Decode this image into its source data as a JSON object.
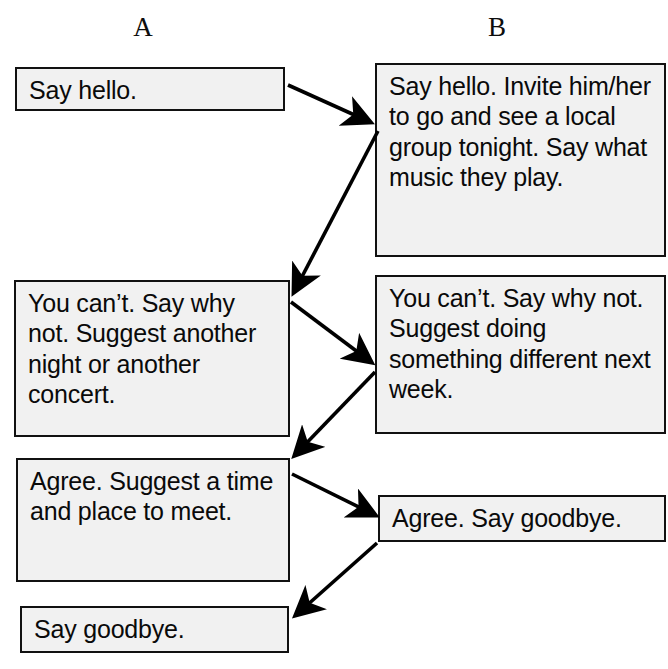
{
  "diagram": {
    "title_absent": "",
    "columns": [
      {
        "key": "A",
        "label": "A"
      },
      {
        "key": "B",
        "label": "B"
      }
    ],
    "colors": {
      "box_fill": "#f1f1f1",
      "box_border": "#111111",
      "text": "#0a0a0a",
      "arrow": "#000000",
      "background": "#ffffff"
    },
    "boxes": {
      "a1": {
        "column": "A",
        "order": 1,
        "text": "Say hello."
      },
      "a2": {
        "column": "A",
        "order": 2,
        "text": "You can’t. Say why not. Suggest another night or another concert."
      },
      "a3": {
        "column": "A",
        "order": 3,
        "text": "Agree. Suggest a time and place to meet."
      },
      "a4": {
        "column": "A",
        "order": 4,
        "text": "Say goodbye."
      },
      "b1": {
        "column": "B",
        "order": 1,
        "text": "Say hello. Invite him/her to go and see a local group tonight. Say what music they play."
      },
      "b2": {
        "column": "B",
        "order": 2,
        "text": "You can’t. Say why not. Suggest doing something different next week."
      },
      "b3": {
        "column": "B",
        "order": 3,
        "text": "Agree. Say goodbye."
      }
    },
    "arrows": [
      {
        "id": "arrow-a1-b1",
        "from": "a1",
        "to": "b1",
        "direction": "right-down"
      },
      {
        "id": "arrow-b1-a2",
        "from": "b1",
        "to": "a2",
        "direction": "left-down"
      },
      {
        "id": "arrow-a2-b2",
        "from": "a2",
        "to": "b2",
        "direction": "right-down"
      },
      {
        "id": "arrow-b2-a3",
        "from": "b2",
        "to": "a3",
        "direction": "left-down"
      },
      {
        "id": "arrow-a3-b3",
        "from": "a3",
        "to": "b3",
        "direction": "right-down"
      },
      {
        "id": "arrow-b3-a4",
        "from": "b3",
        "to": "a4",
        "direction": "left-down"
      }
    ]
  }
}
